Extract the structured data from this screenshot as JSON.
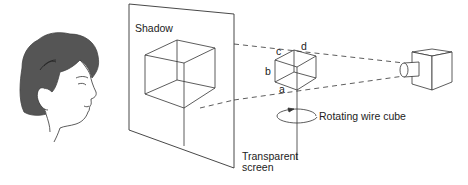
{
  "diagram": {
    "labels": {
      "shadow": "Shadow",
      "screen_line1": "Transparent",
      "screen_line2": "screen",
      "rotating": "Rotating wire cube",
      "vertex_a": "a",
      "vertex_b": "b",
      "vertex_c": "c",
      "vertex_d": "d"
    },
    "elements": [
      "observer-head",
      "transparent-screen",
      "shadow-cube",
      "wire-cube",
      "rotation-arrow",
      "projector-lamp",
      "light-rays"
    ],
    "colors": {
      "line": "#333333",
      "hair": "#555555",
      "background": "#ffffff"
    }
  }
}
